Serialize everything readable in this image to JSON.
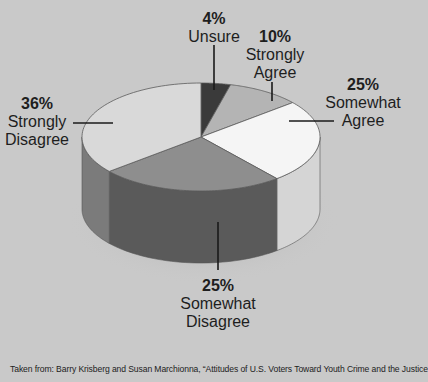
{
  "chart_data": {
    "type": "pie",
    "style": "3d",
    "title": "",
    "categories": [
      "Unsure",
      "Strongly Agree",
      "Somewhat Agree",
      "Somewhat Disagree",
      "Strongly Disagree"
    ],
    "values": [
      4,
      10,
      25,
      25,
      36
    ],
    "unit": "%",
    "colors_top": [
      "#3a3a3a",
      "#b4b4b4",
      "#f5f5f5",
      "#8e8e8e",
      "#d9d9d9"
    ],
    "colors_side": [
      "#2a2a2a",
      "#a3a3a3",
      "#d5d5d5",
      "#5a5a5a",
      "#7b7b7b"
    ],
    "legend": "none (inline callout labels)"
  },
  "labels": {
    "unsure": {
      "pct": "4%",
      "line1": "Unsure",
      "line2": ""
    },
    "strongly_agree": {
      "pct": "10%",
      "line1": "Strongly",
      "line2": "Agree"
    },
    "somewhat_agree": {
      "pct": "25%",
      "line1": "Somewhat",
      "line2": "Agree"
    },
    "somewhat_disagree": {
      "pct": "25%",
      "line1": "Somewhat",
      "line2": "Disagree"
    },
    "strongly_disagree": {
      "pct": "36%",
      "line1": "Strongly",
      "line2": "Disagree"
    }
  },
  "source": "Taken from: Barry Krisberg and Susan Marchionna, “Attitudes of U.S. Voters Toward Youth Crime and the Justice"
}
